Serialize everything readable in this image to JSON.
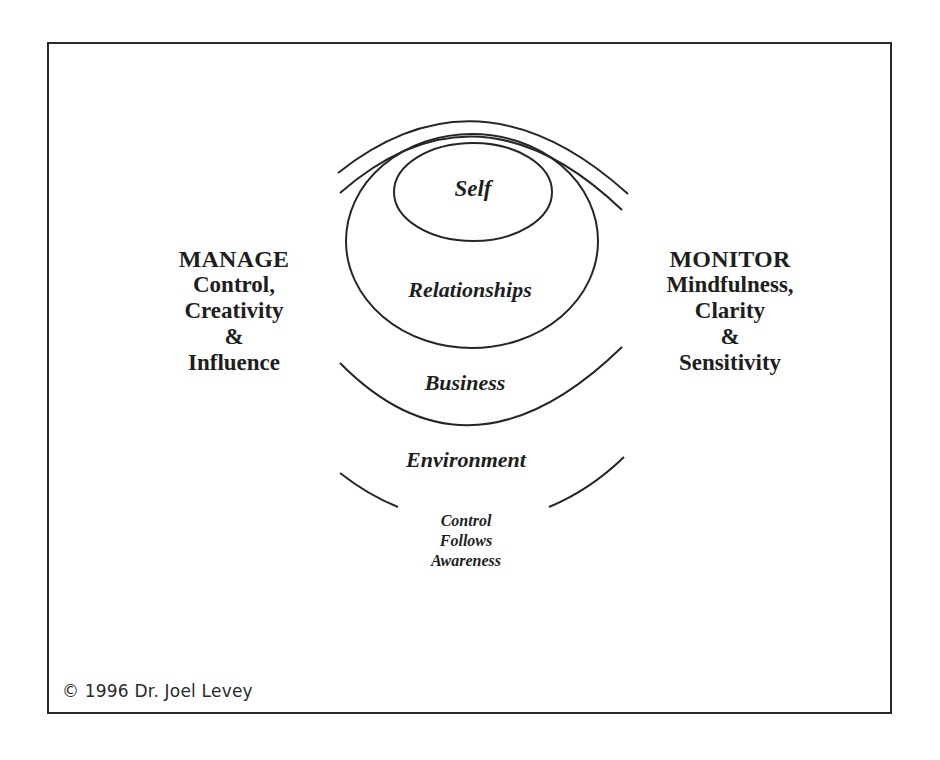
{
  "diagram": {
    "rings": {
      "self": "Self",
      "relationships": "Relationships",
      "business": "Business",
      "environment": "Environment"
    },
    "motto": {
      "line1": "Control",
      "line2": "Follows",
      "line3": "Awareness"
    },
    "left_panel": {
      "heading": "MANAGE",
      "line1": "Control,",
      "line2": "Creativity",
      "line3": "&",
      "line4": "Influence"
    },
    "right_panel": {
      "heading": "MONITOR",
      "line1": "Mindfulness,",
      "line2": "Clarity",
      "line3": "&",
      "line4": "Sensitivity"
    },
    "copyright": "© 1996 Dr. Joel Levey",
    "colors": {
      "stroke": "#262626",
      "text": "#1e1e1e",
      "background": "#ffffff"
    }
  }
}
